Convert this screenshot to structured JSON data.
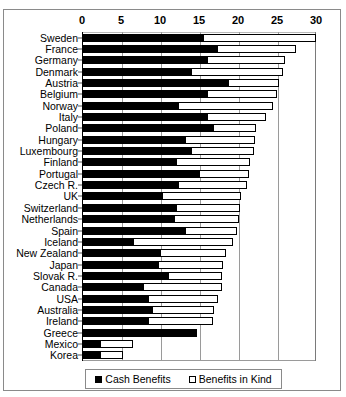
{
  "chart_data": {
    "type": "bar",
    "orientation": "horizontal",
    "stacked": true,
    "title": "",
    "subtitle": "",
    "xlabel": "",
    "ylabel": "",
    "xlim": [
      0,
      30
    ],
    "xticks": [
      0,
      5,
      10,
      15,
      20,
      25,
      30
    ],
    "xticklabels": [
      "0",
      "5",
      "10",
      "15",
      "20",
      "25",
      "30"
    ],
    "grid": true,
    "grid_axis": "x",
    "legend_position": "bottom",
    "categories": [
      "Sweden",
      "France",
      "Germany",
      "Denmark",
      "Austria",
      "Belgium",
      "Norway",
      "Italy",
      "Poland",
      "Hungary",
      "Luxembourg",
      "Finland",
      "Portugal",
      "Czech R.",
      "UK",
      "Switzerland",
      "Netherlands",
      "Spain",
      "Iceland",
      "New Zealand",
      "Japan",
      "Slovak R.",
      "Canada",
      "USA",
      "Australia",
      "Ireland",
      "Greece",
      "Mexico",
      "Korea"
    ],
    "series": [
      {
        "name": "Cash Benefits",
        "color": "#000000",
        "values": [
          15.5,
          17.3,
          16.0,
          14.0,
          18.7,
          16.0,
          12.3,
          16.0,
          16.8,
          13.2,
          14.0,
          12.0,
          15.0,
          12.3,
          10.3,
          12.0,
          11.8,
          13.2,
          6.5,
          10.0,
          9.8,
          11.0,
          7.8,
          8.5,
          9.0,
          8.5,
          14.8,
          2.3,
          2.3
        ]
      },
      {
        "name": "Benefits in Kind",
        "color": "#ffffff",
        "values": [
          14.5,
          10.2,
          10.0,
          11.8,
          6.6,
          9.0,
          12.2,
          7.6,
          5.5,
          9.0,
          8.1,
          9.5,
          6.4,
          8.9,
          10.1,
          8.2,
          8.3,
          6.7,
          12.8,
          8.5,
          8.3,
          7.0,
          10.1,
          8.9,
          7.9,
          8.3,
          0.0,
          4.2,
          3.0
        ]
      }
    ],
    "totals": [
      30.0,
      27.5,
      26.0,
      25.8,
      25.3,
      25.0,
      24.5,
      23.6,
      22.3,
      22.2,
      22.1,
      21.5,
      21.4,
      21.2,
      20.4,
      20.2,
      20.1,
      19.9,
      19.3,
      18.5,
      18.1,
      18.0,
      17.9,
      17.4,
      16.9,
      16.8,
      14.8,
      6.5,
      5.3
    ]
  },
  "legend": {
    "items": [
      {
        "label": "Cash Benefits",
        "swatch": "filled-square-icon"
      },
      {
        "label": "Benefits in Kind",
        "swatch": "hollow-square-icon"
      }
    ]
  }
}
